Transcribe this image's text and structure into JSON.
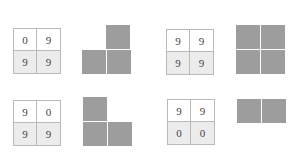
{
  "colors": {
    "block": "#9d9d9d",
    "grid_border": "#b9b9b9",
    "bottom_row_bg": "#ececec",
    "top_row_bg": "#ffffff"
  },
  "panels": [
    {
      "grid": [
        [
          "0",
          "9"
        ],
        [
          "9",
          "9"
        ]
      ],
      "shape": [
        [
          0,
          1
        ],
        [
          1,
          1
        ]
      ]
    },
    {
      "grid": [
        [
          "9",
          "9"
        ],
        [
          "9",
          "9"
        ]
      ],
      "shape": [
        [
          1,
          1
        ],
        [
          1,
          1
        ]
      ]
    },
    {
      "grid": [
        [
          "9",
          "0"
        ],
        [
          "9",
          "9"
        ]
      ],
      "shape": [
        [
          1,
          0
        ],
        [
          1,
          1
        ]
      ]
    },
    {
      "grid": [
        [
          "9",
          "9"
        ],
        [
          "0",
          "0"
        ]
      ],
      "shape": [
        [
          1,
          1
        ],
        [
          0,
          0
        ]
      ]
    }
  ]
}
